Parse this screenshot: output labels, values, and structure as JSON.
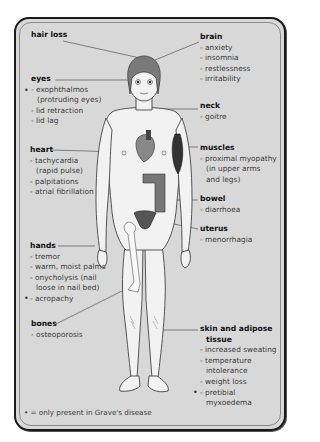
{
  "diagram": {
    "colors": {
      "background": "#d8d8d8",
      "border": "#1a1a1a",
      "body_fill": "#f2f2f2",
      "organ_fill": "#7a7a7a",
      "organ_dark": "#3a3a3a",
      "leader_line": "#555555"
    },
    "labels": {
      "hair_loss": {
        "title": "hair loss",
        "items": []
      },
      "brain": {
        "title": "brain",
        "items": [
          "- anxiety",
          "- insomnia",
          "- restlessness",
          "- irritability"
        ]
      },
      "eyes": {
        "title": "eyes",
        "items": [
          "- exophthalmos",
          "(protruding eyes)",
          "- lid retraction",
          "- lid lag"
        ],
        "graves_marker_on": "- exophthalmos"
      },
      "neck": {
        "title": "neck",
        "items": [
          "- goitre"
        ]
      },
      "heart": {
        "title": "heart",
        "items": [
          "- tachycardia",
          "(rapid pulse)",
          "- palpitations",
          "- atrial fibrillation"
        ]
      },
      "muscles": {
        "title": "muscles",
        "items": [
          "- proximal myopathy",
          "(in upper arms",
          "and legs)"
        ]
      },
      "bowel": {
        "title": "bowel",
        "items": [
          "- diarrhoea"
        ]
      },
      "uterus": {
        "title": "uterus",
        "items": [
          "- menorrhagia"
        ]
      },
      "hands": {
        "title": "hands",
        "items": [
          "- tremor",
          "- warm, moist palms",
          "- onycholysis (nail",
          "loose in nail bed)",
          "- acropachy"
        ],
        "graves_marker_on": "- acropachy"
      },
      "bones": {
        "title": "bones",
        "items": [
          "- osteoporosis"
        ]
      },
      "skin": {
        "title": "skin and adipose",
        "title2": "tissue",
        "items": [
          "- increased sweating",
          "- temperature",
          "intolerance",
          "- weight loss",
          "- pretibial",
          "myxoedema"
        ],
        "graves_marker_on": "- pretibial"
      }
    },
    "bullet_symbol": "•",
    "footnote": "• = only present in Grave's disease"
  }
}
